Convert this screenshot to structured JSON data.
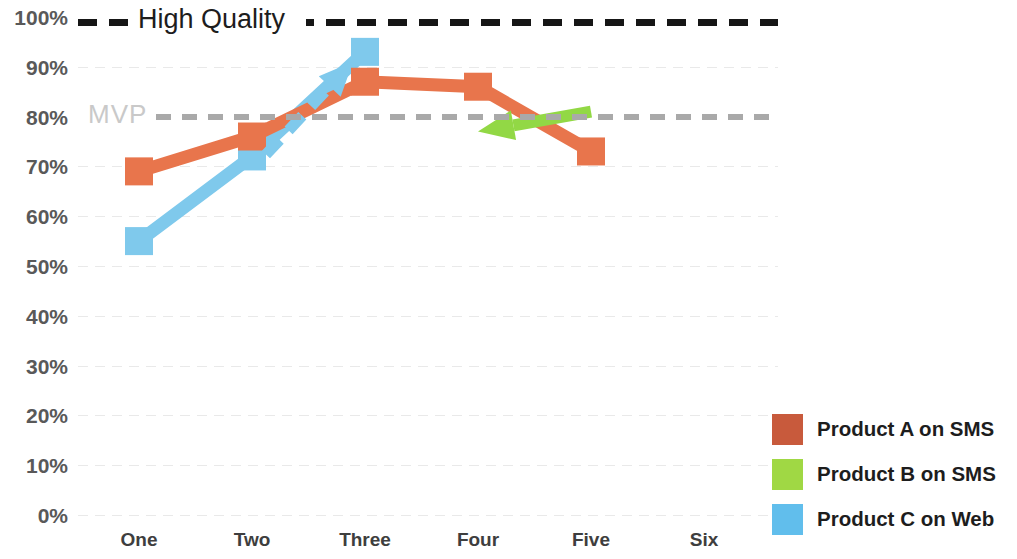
{
  "chart_data": {
    "type": "line",
    "title": "",
    "subtitle": "",
    "xlabel": "",
    "ylabel": "",
    "categories": [
      "One",
      "Two",
      "Three",
      "Four",
      "Five",
      "Six"
    ],
    "ylim": [
      0,
      100
    ],
    "y_tick_labels": [
      "100%",
      "90%",
      "80%",
      "70%",
      "60%",
      "50%",
      "40%",
      "30%",
      "20%",
      "10%",
      "0%"
    ],
    "y_tick_values": [
      100,
      90,
      80,
      70,
      60,
      50,
      40,
      30,
      20,
      10,
      0
    ],
    "grid": true,
    "legend_position": "right-bottom",
    "series": [
      {
        "name": "Product A on SMS",
        "color": "#E8754C",
        "legend_color": "#C85A3C",
        "marker": "square",
        "x": [
          "One",
          "Two",
          "Three",
          "Four",
          "Five"
        ],
        "values": [
          69,
          76,
          87,
          86,
          73
        ]
      },
      {
        "name": "Product B on SMS",
        "color": "#92D845",
        "legend_color": "#A0D844",
        "marker": "arrow",
        "x": [
          "Four",
          "Five"
        ],
        "values": [
          77,
          81
        ],
        "note": "drawn as a left-pointing arrow from Five to Four"
      },
      {
        "name": "Product C on Web",
        "color": "#7FC9EC",
        "legend_color": "#61BEEC",
        "marker": "square",
        "x": [
          "One",
          "Two",
          "Three"
        ],
        "values": [
          55,
          72,
          93
        ]
      }
    ],
    "annotations": [
      {
        "name": "high-quality-threshold",
        "label": "High Quality",
        "value": 99,
        "style": "dashed",
        "color": "#161616",
        "label_color": "#1d1d1d"
      },
      {
        "name": "mvp-threshold",
        "label": "MVP",
        "value": 80,
        "style": "dashed",
        "color": "#a9a9a9",
        "label_color": "#c9c9c9"
      },
      {
        "name": "growth-arrow",
        "label": "",
        "style": "dashed-arrow",
        "color": "#7FC9EC",
        "from": {
          "x": "Two",
          "value": 72
        },
        "to": {
          "x": "Three",
          "value": 91
        }
      }
    ]
  },
  "legend": {
    "items": [
      {
        "label": "Product A on SMS",
        "color": "#C85A3C"
      },
      {
        "label": "Product B on SMS",
        "color": "#A0D844"
      },
      {
        "label": "Product C on Web",
        "color": "#61BEEC"
      }
    ]
  }
}
